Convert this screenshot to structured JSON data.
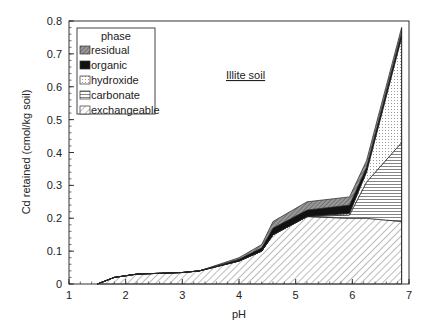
{
  "chart_data": {
    "type": "area",
    "stacked": true,
    "title": "",
    "annotation": "Illite soil",
    "xlabel": "pH",
    "ylabel": "Cd retained (cmol/kg soil)",
    "xlim": [
      1,
      7
    ],
    "ylim": [
      0,
      0.8
    ],
    "x_ticks": [
      "1",
      "2",
      "3",
      "4",
      "5",
      "6",
      "7"
    ],
    "y_ticks": [
      "0",
      "0.1",
      "0.2",
      "0.3",
      "0.4",
      "0.5",
      "0.6",
      "0.7",
      "0.8"
    ],
    "grid": false,
    "legend": {
      "title": "phase",
      "position": "upper-left",
      "entries": [
        "residual",
        "organic",
        "hydroxide",
        "carbonate",
        "exchangeable"
      ]
    },
    "x": [
      1.5,
      1.8,
      2.2,
      3.0,
      3.3,
      4.0,
      4.4,
      4.6,
      5.2,
      5.95,
      6.25,
      6.87
    ],
    "series": [
      {
        "name": "exchangeable",
        "pattern": "diagonal-hatch",
        "values": [
          0.0,
          0.02,
          0.03,
          0.035,
          0.04,
          0.07,
          0.1,
          0.15,
          0.205,
          0.2,
          0.2,
          0.19
        ]
      },
      {
        "name": "carbonate",
        "pattern": "horizontal-lines",
        "values": [
          0.0,
          0.0,
          0.0,
          0.0,
          0.0,
          0.0,
          0.0,
          0.0,
          0.0,
          0.01,
          0.11,
          0.24
        ]
      },
      {
        "name": "hydroxide",
        "pattern": "dots",
        "values": [
          0.0,
          0.0,
          0.0,
          0.0,
          0.0,
          0.0,
          0.0,
          0.0,
          0.0,
          0.005,
          0.03,
          0.32
        ]
      },
      {
        "name": "organic",
        "pattern": "solid-black",
        "values": [
          0.0,
          0.0,
          0.0,
          0.0,
          0.0,
          0.005,
          0.01,
          0.02,
          0.02,
          0.025,
          0.015,
          0.015
        ]
      },
      {
        "name": "residual",
        "pattern": "dense-crosshatch",
        "values": [
          0.0,
          0.0,
          0.0,
          0.0,
          0.0,
          0.005,
          0.01,
          0.02,
          0.025,
          0.025,
          0.02,
          0.015
        ]
      }
    ]
  }
}
